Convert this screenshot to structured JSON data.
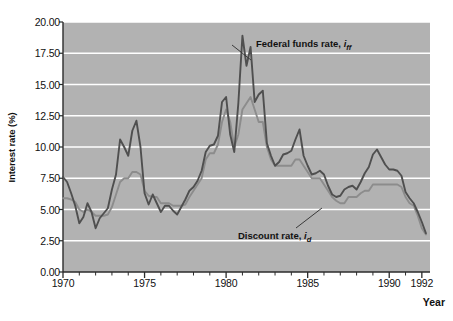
{
  "chart_data": {
    "type": "line",
    "title": "",
    "xlabel": "Year",
    "ylabel": "Interest rate (%)",
    "xlim": [
      1970,
      1992.5
    ],
    "ylim": [
      0.0,
      20.0
    ],
    "grid": true,
    "y_ticks": [
      "0.00",
      "2.50",
      "5.00",
      "7.50",
      "10.00",
      "12.50",
      "15.00",
      "17.50",
      "20.00"
    ],
    "y_tick_values": [
      0.0,
      2.5,
      5.0,
      7.5,
      10.0,
      12.5,
      15.0,
      17.5,
      20.0
    ],
    "x_ticks": [
      "1970",
      "1975",
      "1980",
      "1985",
      "1990",
      "1992"
    ],
    "x_tick_values": [
      1970,
      1975,
      1980,
      1985,
      1990,
      1992
    ],
    "x_minor_step": 1,
    "legend_position": "inline-annotations",
    "plot_bg_color": "#b2b2b2",
    "gridline_color": "#ffffff",
    "series": [
      {
        "name": "Federal funds rate",
        "symbol": "i_ff",
        "annotation": "Federal funds rate, i",
        "annotation_sub": "ff",
        "color": "#4f4f4f",
        "x": [
          1970.0,
          1970.25,
          1970.5,
          1970.75,
          1971.0,
          1971.25,
          1971.5,
          1971.75,
          1972.0,
          1972.25,
          1972.5,
          1972.75,
          1973.0,
          1973.25,
          1973.5,
          1973.75,
          1974.0,
          1974.25,
          1974.5,
          1974.75,
          1975.0,
          1975.25,
          1975.5,
          1975.75,
          1976.0,
          1976.25,
          1976.5,
          1976.75,
          1977.0,
          1977.25,
          1977.5,
          1977.75,
          1978.0,
          1978.25,
          1978.5,
          1978.75,
          1979.0,
          1979.25,
          1979.5,
          1979.75,
          1980.0,
          1980.25,
          1980.5,
          1980.75,
          1981.0,
          1981.25,
          1981.5,
          1981.75,
          1982.0,
          1982.25,
          1982.5,
          1982.75,
          1983.0,
          1983.25,
          1983.5,
          1983.75,
          1984.0,
          1984.25,
          1984.5,
          1984.75,
          1985.0,
          1985.25,
          1985.5,
          1985.75,
          1986.0,
          1986.25,
          1986.5,
          1986.75,
          1987.0,
          1987.25,
          1987.5,
          1987.75,
          1988.0,
          1988.25,
          1988.5,
          1988.75,
          1989.0,
          1989.25,
          1989.5,
          1989.75,
          1990.0,
          1990.25,
          1990.5,
          1990.75,
          1991.0,
          1991.25,
          1991.5,
          1991.75,
          1992.0,
          1992.25
        ],
        "y": [
          7.6,
          7.2,
          6.3,
          5.3,
          3.9,
          4.4,
          5.5,
          4.8,
          3.5,
          4.3,
          4.7,
          5.1,
          6.6,
          7.8,
          10.6,
          10.0,
          9.3,
          11.3,
          12.1,
          10.0,
          6.3,
          5.4,
          6.2,
          5.5,
          4.8,
          5.3,
          5.3,
          4.9,
          4.6,
          5.2,
          5.8,
          6.5,
          6.8,
          7.3,
          8.1,
          9.6,
          10.1,
          10.2,
          10.9,
          13.6,
          14.0,
          11.0,
          9.6,
          13.5,
          18.9,
          16.5,
          18.0,
          13.6,
          14.2,
          14.5,
          10.3,
          9.3,
          8.5,
          8.8,
          9.4,
          9.5,
          9.7,
          10.6,
          11.4,
          9.3,
          8.5,
          7.8,
          7.9,
          8.1,
          7.8,
          6.9,
          6.2,
          6.0,
          6.1,
          6.6,
          6.8,
          6.9,
          6.6,
          7.2,
          7.9,
          8.4,
          9.4,
          9.8,
          9.2,
          8.6,
          8.2,
          8.2,
          8.1,
          7.7,
          6.4,
          5.9,
          5.5,
          4.8,
          4.0,
          3.1
        ]
      },
      {
        "name": "Discount rate",
        "symbol": "i_d",
        "annotation": "Discount rate, i",
        "annotation_sub": "d",
        "color": "#8c8c8c",
        "x": [
          1970.0,
          1970.25,
          1970.5,
          1970.75,
          1971.0,
          1971.25,
          1971.5,
          1971.75,
          1972.0,
          1972.25,
          1972.5,
          1972.75,
          1973.0,
          1973.25,
          1973.5,
          1973.75,
          1974.0,
          1974.25,
          1974.5,
          1974.75,
          1975.0,
          1975.25,
          1975.5,
          1975.75,
          1976.0,
          1976.25,
          1976.5,
          1976.75,
          1977.0,
          1977.25,
          1977.5,
          1977.75,
          1978.0,
          1978.25,
          1978.5,
          1978.75,
          1979.0,
          1979.25,
          1979.5,
          1979.75,
          1980.0,
          1980.25,
          1980.5,
          1980.75,
          1981.0,
          1981.25,
          1981.5,
          1981.75,
          1982.0,
          1982.25,
          1982.5,
          1982.75,
          1983.0,
          1983.25,
          1983.5,
          1983.75,
          1984.0,
          1984.25,
          1984.5,
          1984.75,
          1985.0,
          1985.25,
          1985.5,
          1985.75,
          1986.0,
          1986.25,
          1986.5,
          1986.75,
          1987.0,
          1987.25,
          1987.5,
          1987.75,
          1988.0,
          1988.25,
          1988.5,
          1988.75,
          1989.0,
          1989.25,
          1989.5,
          1989.75,
          1990.0,
          1990.25,
          1990.5,
          1990.75,
          1991.0,
          1991.25,
          1991.5,
          1991.75,
          1992.0,
          1992.25
        ],
        "y": [
          5.9,
          5.9,
          5.8,
          5.6,
          5.0,
          4.8,
          5.0,
          4.8,
          4.5,
          4.5,
          4.5,
          4.6,
          5.2,
          6.2,
          7.2,
          7.5,
          7.5,
          8.0,
          8.0,
          7.8,
          6.5,
          6.1,
          6.0,
          6.0,
          5.5,
          5.5,
          5.5,
          5.3,
          5.3,
          5.3,
          5.4,
          6.0,
          6.5,
          7.0,
          7.5,
          9.0,
          9.5,
          9.5,
          10.2,
          12.0,
          13.0,
          12.0,
          10.0,
          11.0,
          13.0,
          13.5,
          14.0,
          13.0,
          12.0,
          12.0,
          10.0,
          9.0,
          8.5,
          8.5,
          8.5,
          8.5,
          8.5,
          9.0,
          9.0,
          8.5,
          8.0,
          7.5,
          7.5,
          7.5,
          7.0,
          6.5,
          6.0,
          5.7,
          5.5,
          5.5,
          6.0,
          6.0,
          6.0,
          6.3,
          6.5,
          6.5,
          7.0,
          7.0,
          7.0,
          7.0,
          7.0,
          7.0,
          7.0,
          6.8,
          6.0,
          5.5,
          5.3,
          4.5,
          3.5,
          3.0
        ]
      }
    ]
  },
  "axis": {
    "y_title": "Interest rate (%)",
    "x_title": "Year"
  }
}
